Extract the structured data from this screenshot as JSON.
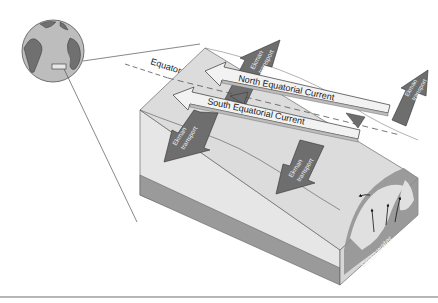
{
  "diagram": {
    "labels": {
      "equator": "Equator",
      "north_current": "North Equatorial Current",
      "south_current": "South Equatorial Current",
      "ekman_line1": "Ekman",
      "ekman_line2": "transport",
      "deep_water": "Deep water"
    },
    "colors": {
      "surface": "#dcdcdc",
      "block_front": "#e6e6e6",
      "block_side": "#d4d4d4",
      "bottom_layer": "#9a9a9a",
      "ekman_arrow": "#6e6e6e",
      "current_arrow": "#f2f2f2",
      "globe_ocean": "#bdbdbd",
      "globe_land": "#707070",
      "outline": "#333333",
      "divider": "#9e9e9e"
    },
    "ekman_arrows": [
      {
        "id": "north-left",
        "direction": "north"
      },
      {
        "id": "north-right",
        "direction": "north"
      },
      {
        "id": "south-left",
        "direction": "south"
      },
      {
        "id": "south-right",
        "direction": "south"
      }
    ]
  }
}
